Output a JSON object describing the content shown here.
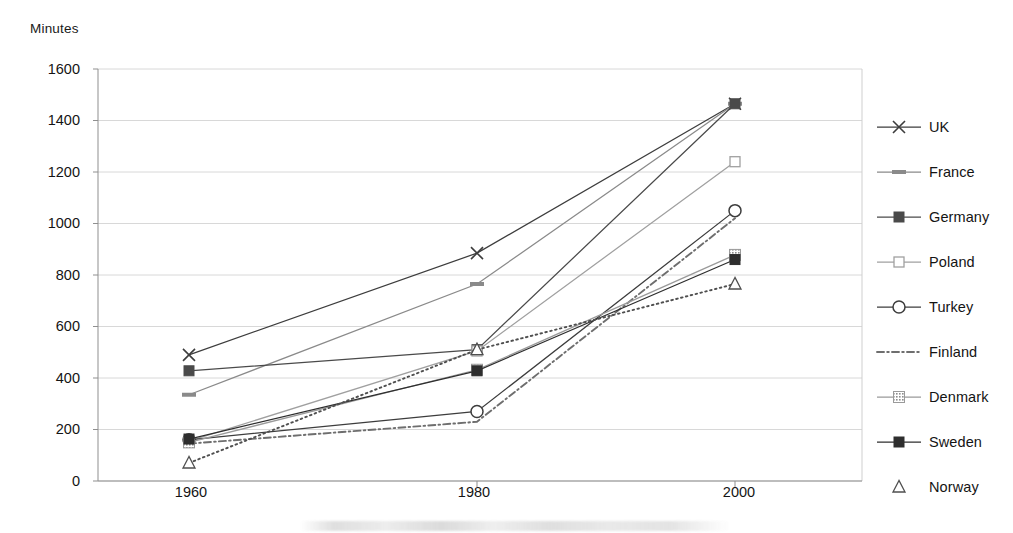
{
  "chart_data": {
    "type": "line",
    "title": "",
    "ylabel": "Minutes",
    "xlabel": "",
    "categories": [
      "1960",
      "1980",
      "2000"
    ],
    "x": [
      1960,
      1980,
      2000
    ],
    "ylim": [
      0,
      1600
    ],
    "ytick_values": [
      0,
      200,
      400,
      600,
      800,
      1000,
      1200,
      1400,
      1600
    ],
    "ytick_labels": [
      "0",
      "200",
      "400",
      "600",
      "800",
      "1000",
      "1200",
      "1400",
      "1600"
    ],
    "grid": true,
    "legend_position": "right",
    "series": [
      {
        "name": "UK",
        "marker": "x",
        "line": "solid",
        "color": "#3d3d3d",
        "values": [
          490,
          885,
          1465
        ]
      },
      {
        "name": "France",
        "marker": "dash",
        "line": "solid",
        "color": "#8a8a8a",
        "values": [
          335,
          765,
          1465
        ]
      },
      {
        "name": "Germany",
        "marker": "filled-square",
        "line": "solid",
        "color": "#4a4a4a",
        "values": [
          428,
          510,
          1465
        ]
      },
      {
        "name": "Poland",
        "marker": "open-square",
        "line": "solid",
        "color": "#a0a0a0",
        "values": [
          155,
          505,
          1240
        ]
      },
      {
        "name": "Turkey",
        "marker": "open-circle",
        "line": "solid",
        "color": "#3d3d3d",
        "values": [
          160,
          270,
          1050
        ]
      },
      {
        "name": "Finland",
        "marker": "none",
        "line": "dash-dot",
        "color": "#6e6e6e",
        "values": [
          145,
          230,
          1020
        ]
      },
      {
        "name": "Denmark",
        "marker": "hatch-square",
        "line": "solid",
        "color": "#9a9a9a",
        "values": [
          150,
          432,
          878
        ]
      },
      {
        "name": "Sweden",
        "marker": "filled-square",
        "line": "solid",
        "color": "#2e2e2e",
        "values": [
          163,
          428,
          860
        ]
      },
      {
        "name": "Norway",
        "marker": "open-triangle",
        "line": "dotted",
        "color": "#4f4f4f",
        "values": [
          70,
          510,
          765
        ]
      }
    ]
  },
  "axis": {
    "y_title": "Minutes",
    "y_ticks": [
      "1600",
      "1400",
      "1200",
      "1000",
      "800",
      "600",
      "400",
      "200",
      "0"
    ],
    "x_ticks": [
      "1960",
      "1980",
      "2000"
    ]
  },
  "legend": {
    "items": [
      {
        "label": "UK"
      },
      {
        "label": "France"
      },
      {
        "label": "Germany"
      },
      {
        "label": "Poland"
      },
      {
        "label": "Turkey"
      },
      {
        "label": "Finland"
      },
      {
        "label": "Denmark"
      },
      {
        "label": "Sweden"
      },
      {
        "label": "Norway"
      }
    ]
  }
}
